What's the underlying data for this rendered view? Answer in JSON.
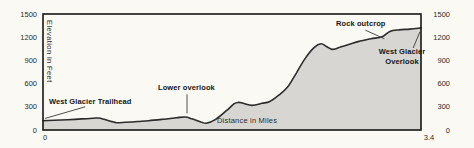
{
  "figure": {
    "bg_color": "#fbf9f3",
    "area_fill": "#d7d6d2",
    "line_color": "#2b2b2b",
    "frame_color": "#161616",
    "pointer_color": "#3a3a3a"
  },
  "chart_data": {
    "type": "area",
    "title": "",
    "xlabel": "Distance in Miles",
    "ylabel": "Elevation in Feet",
    "xlim": [
      0,
      3.4
    ],
    "ylim": [
      0,
      1500
    ],
    "grid": false,
    "xtick_values": [
      0,
      3.4
    ],
    "xtick_labels": [
      "0",
      "3.4"
    ],
    "ytick_values": [
      0,
      300,
      600,
      900,
      1200,
      1500
    ],
    "ytick_labels": [
      "0",
      "300",
      "600",
      "900",
      "1200",
      "1500"
    ],
    "ytick_sides": "both",
    "points": {
      "x": [
        0.0,
        0.1,
        0.22,
        0.35,
        0.45,
        0.5,
        0.55,
        0.62,
        0.66,
        0.74,
        0.85,
        0.95,
        1.08,
        1.2,
        1.28,
        1.34,
        1.42,
        1.47,
        1.55,
        1.65,
        1.72,
        1.76,
        1.8,
        1.88,
        1.97,
        2.04,
        2.12,
        2.2,
        2.28,
        2.36,
        2.44,
        2.5,
        2.55,
        2.6,
        2.67,
        2.75,
        2.85,
        2.95,
        3.05,
        3.12,
        3.2,
        3.3,
        3.4
      ],
      "y": [
        120,
        126,
        133,
        143,
        152,
        155,
        138,
        108,
        95,
        100,
        110,
        120,
        138,
        158,
        168,
        145,
        105,
        88,
        135,
        250,
        340,
        357,
        345,
        318,
        345,
        368,
        450,
        555,
        740,
        930,
        1070,
        1115,
        1080,
        1042,
        1070,
        1105,
        1150,
        1180,
        1205,
        1275,
        1295,
        1305,
        1320
      ]
    },
    "annotations": [
      {
        "text": "West Glacier Trailhead",
        "pointer": [
          [
            0.38,
            300
          ],
          [
            0.02,
            150
          ]
        ]
      },
      {
        "text": "Lower overlook",
        "pointer": [
          [
            1.295,
            460
          ],
          [
            1.295,
            215
          ]
        ]
      },
      {
        "text": "Rock outcrop",
        "pointer": [
          [
            2.9,
            1290
          ],
          [
            3.07,
            1180
          ]
        ]
      },
      {
        "text": "West Glacier Overlook",
        "pointer": [
          [
            3.33,
            1060
          ],
          [
            3.39,
            1270
          ]
        ]
      }
    ]
  }
}
